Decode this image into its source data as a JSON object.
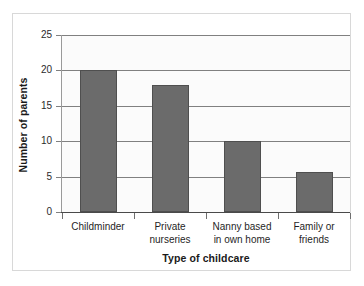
{
  "chart_data": {
    "type": "bar",
    "title": "",
    "xlabel": "Type of childcare",
    "ylabel": "Number of parents",
    "categories": [
      "Childminder",
      "Private nurseries",
      "Nanny based in own home",
      "Family or friends"
    ],
    "category_lines": [
      [
        "Childminder"
      ],
      [
        "Private",
        "nurseries"
      ],
      [
        "Nanny based",
        "in own home"
      ],
      [
        "Family or",
        "friends"
      ]
    ],
    "values": [
      20,
      18,
      10,
      5.7
    ],
    "ylim": [
      0,
      25
    ],
    "yticks": [
      0,
      5,
      10,
      15,
      20,
      25
    ],
    "ytick_labels": [
      "0",
      "5",
      "10",
      "15",
      "20",
      "25"
    ],
    "grid": true,
    "legend": false,
    "bar_color": "#6b6b6b",
    "bar_edge_color": "#4f4f4f",
    "grid_color": "#808080",
    "axis_color": "#4a4a4a",
    "plot_background": "#fbfbfb",
    "figure_background": "#ffffff",
    "frame_color": "#d8d8d8"
  }
}
